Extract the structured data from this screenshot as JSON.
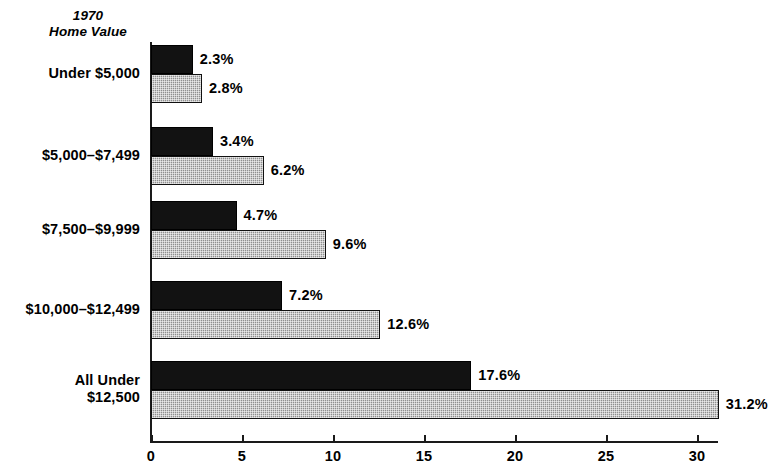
{
  "chart_title": {
    "line1": "1970",
    "line2": "Home Value"
  },
  "chart_data": {
    "type": "bar",
    "orientation": "horizontal",
    "title": "1970 Home Value",
    "xlabel": "",
    "ylabel": "1970 Home Value",
    "xlim": [
      0,
      32
    ],
    "grid": false,
    "legend": null,
    "value_suffix": "%",
    "categories": [
      "Under $5,000",
      "$5,000–$7,499",
      "$7,500–$9,999",
      "$10,000–$12,499",
      "All Under\n$12,500"
    ],
    "series": [
      {
        "name": "dark",
        "style": "solid-black",
        "values": [
          2.3,
          3.4,
          4.7,
          7.2,
          17.6
        ],
        "labels": [
          "2.3%",
          "3.4%",
          "4.7%",
          "7.2%",
          "17.6%"
        ]
      },
      {
        "name": "light",
        "style": "gray-stippled",
        "values": [
          2.8,
          6.2,
          9.6,
          12.6,
          31.2
        ],
        "labels": [
          "2.8%",
          "6.2%",
          "9.6%",
          "12.6%",
          "31.2%"
        ]
      }
    ],
    "xticks": [
      0,
      5,
      10,
      15,
      20,
      25,
      30
    ],
    "xtick_labels": [
      "0",
      "5",
      "10",
      "15",
      "20",
      "25",
      "30"
    ]
  },
  "colors": {
    "dark_bar": "#121212",
    "light_bar": "#8f8f8f",
    "axis": "#1a1a1a",
    "text": "#000000",
    "background": "#ffffff"
  }
}
